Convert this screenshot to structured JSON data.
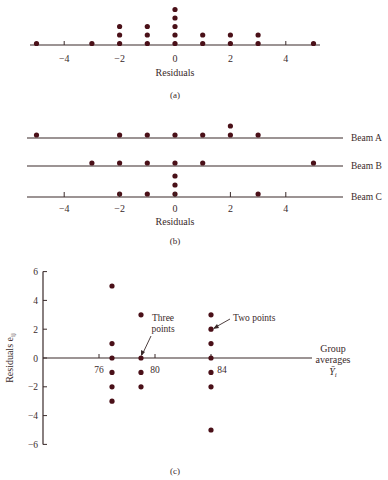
{
  "colors": {
    "dot": "#4a1018",
    "line": "#3a2a2a",
    "text": "#3a2a2a"
  },
  "chart_data": [
    {
      "type": "scatter",
      "subtype": "dot-plot",
      "title": "",
      "caption": "(a)",
      "xlabel": "Residuals",
      "ylabel": "",
      "xlim": [
        -5.5,
        5.5
      ],
      "xticks": [
        -4,
        -2,
        0,
        2,
        4
      ],
      "xtick_labels": [
        "−4",
        "−2",
        "0",
        "2",
        "4"
      ],
      "grid": false,
      "counts": [
        {
          "x": -5,
          "n": 1
        },
        {
          "x": -3,
          "n": 1
        },
        {
          "x": -2,
          "n": 3
        },
        {
          "x": -1,
          "n": 3
        },
        {
          "x": 0,
          "n": 5
        },
        {
          "x": 1,
          "n": 2
        },
        {
          "x": 2,
          "n": 2
        },
        {
          "x": 3,
          "n": 2
        },
        {
          "x": 5,
          "n": 1
        }
      ]
    },
    {
      "type": "scatter",
      "subtype": "dot-plot-by-group",
      "caption": "(b)",
      "xlabel": "Residuals",
      "xlim": [
        -5.5,
        5.5
      ],
      "xticks": [
        -4,
        -2,
        0,
        2,
        4
      ],
      "xtick_labels": [
        "−4",
        "−2",
        "0",
        "2",
        "4"
      ],
      "series": [
        {
          "name": "Beam A",
          "counts": [
            {
              "x": -5,
              "n": 1
            },
            {
              "x": -2,
              "n": 1
            },
            {
              "x": -1,
              "n": 1
            },
            {
              "x": 0,
              "n": 1
            },
            {
              "x": 1,
              "n": 1
            },
            {
              "x": 2,
              "n": 2
            },
            {
              "x": 3,
              "n": 1
            }
          ]
        },
        {
          "name": "Beam B",
          "counts": [
            {
              "x": -3,
              "n": 1
            },
            {
              "x": -2,
              "n": 1
            },
            {
              "x": -1,
              "n": 1
            },
            {
              "x": 0,
              "n": 1
            },
            {
              "x": 1,
              "n": 1
            },
            {
              "x": 5,
              "n": 1
            }
          ]
        },
        {
          "name": "Beam C",
          "counts": [
            {
              "x": -2,
              "n": 1
            },
            {
              "x": -1,
              "n": 1
            },
            {
              "x": 0,
              "n": 3
            },
            {
              "x": 3,
              "n": 1
            }
          ]
        }
      ]
    },
    {
      "type": "scatter",
      "caption": "(c)",
      "xlabel": "Group averages Ȳi",
      "xlabel_lines": [
        "Group",
        "averages",
        "Ȳ"
      ],
      "xlabel_sub": "i",
      "ylabel": "Residuals e",
      "ylabel_sub": "ij",
      "xticks": [
        76,
        80,
        84
      ],
      "yticks": [
        6,
        4,
        2,
        0,
        -2,
        -4,
        -6
      ],
      "ytick_labels": [
        "6",
        "4",
        "2",
        "0",
        "−2",
        "−4",
        "−6"
      ],
      "ylim": [
        -6,
        6
      ],
      "grid": false,
      "points": [
        {
          "x": 77,
          "y": 5
        },
        {
          "x": 77,
          "y": 1
        },
        {
          "x": 77,
          "y": 0
        },
        {
          "x": 77,
          "y": -1
        },
        {
          "x": 77,
          "y": -2
        },
        {
          "x": 77,
          "y": -3
        },
        {
          "x": 79,
          "y": 3
        },
        {
          "x": 79,
          "y": 0,
          "n": 3
        },
        {
          "x": 79,
          "y": -1
        },
        {
          "x": 79,
          "y": -2
        },
        {
          "x": 84,
          "y": 3
        },
        {
          "x": 84,
          "y": 2,
          "n": 2
        },
        {
          "x": 84,
          "y": 1
        },
        {
          "x": 84,
          "y": 0
        },
        {
          "x": 84,
          "y": -1
        },
        {
          "x": 84,
          "y": -2
        },
        {
          "x": 84,
          "y": -5
        }
      ],
      "annotations": [
        {
          "text_lines": [
            "Three",
            "points"
          ],
          "x": 79,
          "y": 0
        },
        {
          "text": "Two points",
          "x": 84,
          "y": 2
        }
      ]
    }
  ]
}
